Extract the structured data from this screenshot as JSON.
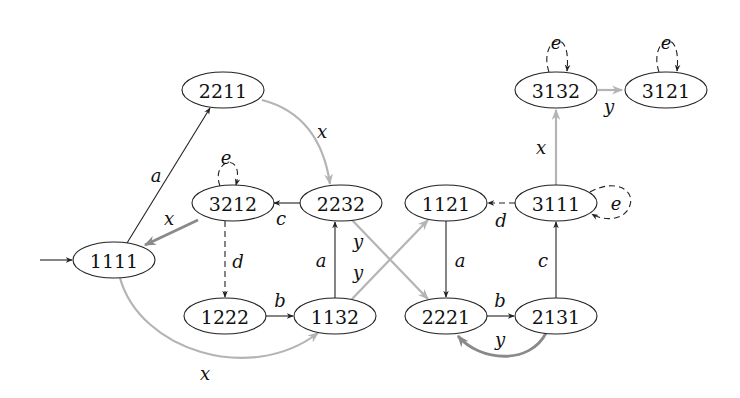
{
  "diagram": {
    "type": "state-transition-graph",
    "initial_state": "1111",
    "colors": {
      "node_stroke": "#222222",
      "black_edge": "#222222",
      "gray_edge": "#b4b4b4",
      "dark_gray_edge": "#8a8a8a",
      "background": "#ffffff"
    },
    "nodes": [
      {
        "id": "1111",
        "label": "1111"
      },
      {
        "id": "2211",
        "label": "2211"
      },
      {
        "id": "3212",
        "label": "3212"
      },
      {
        "id": "2232",
        "label": "2232"
      },
      {
        "id": "1222",
        "label": "1222"
      },
      {
        "id": "1132",
        "label": "1132"
      },
      {
        "id": "1121",
        "label": "1121"
      },
      {
        "id": "3111",
        "label": "3111"
      },
      {
        "id": "2221",
        "label": "2221"
      },
      {
        "id": "2131",
        "label": "2131"
      },
      {
        "id": "3132",
        "label": "3132"
      },
      {
        "id": "3121",
        "label": "3121"
      }
    ],
    "edges": [
      {
        "from": "1111",
        "to": "2211",
        "label": "a",
        "style": "black"
      },
      {
        "from": "2211",
        "to": "2232",
        "label": "x",
        "style": "gray"
      },
      {
        "from": "3212",
        "to": "3212",
        "label": "e",
        "style": "dashed"
      },
      {
        "from": "3212",
        "to": "1111",
        "label": "x",
        "style": "dark-gray"
      },
      {
        "from": "2232",
        "to": "3212",
        "label": "c",
        "style": "black"
      },
      {
        "from": "3212",
        "to": "1222",
        "label": "d",
        "style": "dashed"
      },
      {
        "from": "1222",
        "to": "1132",
        "label": "b",
        "style": "black"
      },
      {
        "from": "1132",
        "to": "2232",
        "label": "a",
        "style": "black"
      },
      {
        "from": "1111",
        "to": "1132",
        "label": "x",
        "style": "gray"
      },
      {
        "from": "2232",
        "to": "2221",
        "label": "y",
        "style": "gray"
      },
      {
        "from": "1132",
        "to": "1121",
        "label": "y",
        "style": "gray"
      },
      {
        "from": "3111",
        "to": "1121",
        "label": "d",
        "style": "dashed"
      },
      {
        "from": "3111",
        "to": "3111",
        "label": "e",
        "style": "dashed"
      },
      {
        "from": "1121",
        "to": "2221",
        "label": "a",
        "style": "black"
      },
      {
        "from": "2221",
        "to": "2131",
        "label": "b",
        "style": "black"
      },
      {
        "from": "2131",
        "to": "2221",
        "label": "y",
        "style": "dark-gray"
      },
      {
        "from": "2131",
        "to": "3111",
        "label": "c",
        "style": "black"
      },
      {
        "from": "3111",
        "to": "3132",
        "label": "x",
        "style": "gray"
      },
      {
        "from": "3132",
        "to": "3132",
        "label": "e",
        "style": "dashed"
      },
      {
        "from": "3132",
        "to": "3121",
        "label": "y",
        "style": "gray"
      },
      {
        "from": "3121",
        "to": "3121",
        "label": "e",
        "style": "dashed"
      }
    ],
    "edge_labels": {
      "a_1111_2211": "a",
      "x_2211_2232": "x",
      "e_3212": "e",
      "x_3212_1111": "x",
      "c_2232_3212": "c",
      "d_3212_1222": "d",
      "b_1222_1132": "b",
      "a_1132_2232": "a",
      "x_1111_1132": "x",
      "y_2232_2221": "y",
      "y_1132_1121": "y",
      "d_3111_1121": "d",
      "e_3111": "e",
      "a_1121_2221": "a",
      "b_2221_2131": "b",
      "y_2131_2221": "y",
      "c_2131_3111": "c",
      "x_3111_3132": "x",
      "e_3132": "e",
      "y_3132_3121": "y",
      "e_3121": "e"
    }
  }
}
